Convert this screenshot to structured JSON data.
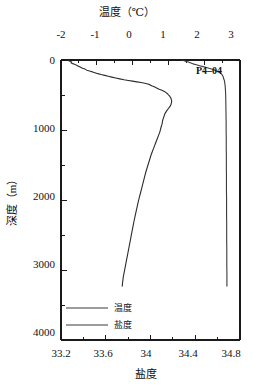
{
  "chart_data": {
    "type": "line",
    "title": "",
    "orientation": "vertical-profile",
    "station": "P4–04",
    "grid": false,
    "legend_position": "bottom-left-inside",
    "top_axis": {
      "label": "温度（℃）",
      "ticks": [
        -2,
        -1,
        0,
        1,
        2,
        3
      ],
      "tick_labels": [
        "-2",
        "-1",
        "0",
        "1",
        "2",
        "3"
      ],
      "range": [
        -2,
        3
      ],
      "minor_tick_step": 0.5
    },
    "bottom_axis": {
      "label": "盐度",
      "ticks": [
        33.2,
        33.6,
        34,
        34.4,
        34.8
      ],
      "tick_labels": [
        "33.2",
        "33.6",
        "34",
        "34.4",
        "34.8"
      ],
      "range": [
        33.2,
        34.8
      ],
      "minor_tick_step": 0.2
    },
    "y_axis": {
      "label": "深度（m）",
      "ticks": [
        0,
        1000,
        2000,
        3000,
        4000
      ],
      "tick_labels": [
        "0",
        "1000",
        "2000",
        "3000",
        "4000"
      ],
      "range": [
        0,
        4000
      ],
      "inverted": true,
      "minor_tick_step": 500
    },
    "series": [
      {
        "name": "温度",
        "legend_label": "温度",
        "axis": "top",
        "unit": "℃",
        "color": "#2b2b2b",
        "points": [
          [
            -1.8,
            0
          ],
          [
            -1.78,
            12
          ],
          [
            -1.74,
            22
          ],
          [
            -1.7,
            30
          ],
          [
            -1.72,
            40
          ],
          [
            -1.68,
            52
          ],
          [
            -1.62,
            62
          ],
          [
            -1.58,
            70
          ],
          [
            -1.55,
            80
          ],
          [
            -1.5,
            92
          ],
          [
            -1.45,
            105
          ],
          [
            -1.4,
            118
          ],
          [
            -1.33,
            130
          ],
          [
            -1.28,
            145
          ],
          [
            -1.2,
            158
          ],
          [
            -1.12,
            170
          ],
          [
            -1.05,
            182
          ],
          [
            -0.97,
            195
          ],
          [
            -0.88,
            208
          ],
          [
            -0.78,
            220
          ],
          [
            -0.68,
            232
          ],
          [
            -0.58,
            245
          ],
          [
            -0.47,
            258
          ],
          [
            -0.36,
            270
          ],
          [
            -0.24,
            282
          ],
          [
            -0.12,
            292
          ],
          [
            0.0,
            302
          ],
          [
            0.12,
            312
          ],
          [
            0.24,
            322
          ],
          [
            0.34,
            332
          ],
          [
            0.42,
            342
          ],
          [
            0.48,
            352
          ],
          [
            0.5,
            360
          ],
          [
            0.55,
            372
          ],
          [
            0.62,
            385
          ],
          [
            0.66,
            396
          ],
          [
            0.7,
            406
          ],
          [
            0.74,
            418
          ],
          [
            0.8,
            430
          ],
          [
            0.86,
            442
          ],
          [
            0.9,
            452
          ],
          [
            0.92,
            462
          ],
          [
            0.95,
            472
          ],
          [
            0.98,
            485
          ],
          [
            1.0,
            498
          ],
          [
            1.03,
            512
          ],
          [
            1.05,
            528
          ],
          [
            1.07,
            545
          ],
          [
            1.08,
            562
          ],
          [
            1.09,
            580
          ],
          [
            1.09,
            600
          ],
          [
            1.08,
            620
          ],
          [
            1.07,
            640
          ],
          [
            1.05,
            660
          ],
          [
            1.02,
            680
          ],
          [
            0.99,
            700
          ],
          [
            0.96,
            720
          ],
          [
            0.93,
            745
          ],
          [
            0.9,
            770
          ],
          [
            0.88,
            800
          ],
          [
            0.86,
            830
          ],
          [
            0.84,
            860
          ],
          [
            0.83,
            890
          ],
          [
            0.82,
            920
          ],
          [
            0.8,
            950
          ],
          [
            0.78,
            990
          ],
          [
            0.76,
            1030
          ],
          [
            0.73,
            1070
          ],
          [
            0.7,
            1110
          ],
          [
            0.67,
            1150
          ],
          [
            0.64,
            1190
          ],
          [
            0.61,
            1230
          ],
          [
            0.58,
            1270
          ],
          [
            0.55,
            1310
          ],
          [
            0.52,
            1350
          ],
          [
            0.49,
            1400
          ],
          [
            0.46,
            1450
          ],
          [
            0.43,
            1500
          ],
          [
            0.4,
            1550
          ],
          [
            0.37,
            1600
          ],
          [
            0.34,
            1660
          ],
          [
            0.31,
            1720
          ],
          [
            0.28,
            1780
          ],
          [
            0.25,
            1840
          ],
          [
            0.22,
            1900
          ],
          [
            0.19,
            1960
          ],
          [
            0.16,
            2020
          ],
          [
            0.13,
            2090
          ],
          [
            0.1,
            2160
          ],
          [
            0.07,
            2230
          ],
          [
            0.04,
            2300
          ],
          [
            0.01,
            2380
          ],
          [
            -0.02,
            2460
          ],
          [
            -0.05,
            2540
          ],
          [
            -0.08,
            2620
          ],
          [
            -0.11,
            2700
          ],
          [
            -0.14,
            2780
          ],
          [
            -0.17,
            2860
          ],
          [
            -0.2,
            2940
          ],
          [
            -0.23,
            3020
          ],
          [
            -0.26,
            3100
          ],
          [
            -0.28,
            3180
          ],
          [
            -0.29,
            3230
          ]
        ]
      },
      {
        "name": "盐度",
        "legend_label": "盐度",
        "axis": "bottom",
        "unit": "",
        "color": "#3a3a3a",
        "points": [
          [
            34.28,
            0
          ],
          [
            34.3,
            10
          ],
          [
            34.32,
            20
          ],
          [
            34.34,
            30
          ],
          [
            34.36,
            42
          ],
          [
            34.38,
            55
          ],
          [
            34.41,
            68
          ],
          [
            34.44,
            82
          ],
          [
            34.47,
            95
          ],
          [
            34.5,
            108
          ],
          [
            34.53,
            122
          ],
          [
            34.56,
            136
          ],
          [
            34.58,
            150
          ],
          [
            34.6,
            165
          ],
          [
            34.62,
            180
          ],
          [
            34.63,
            195
          ],
          [
            34.64,
            210
          ],
          [
            34.645,
            225
          ],
          [
            34.65,
            240
          ],
          [
            34.652,
            255
          ],
          [
            34.655,
            272
          ],
          [
            34.66,
            290
          ],
          [
            34.662,
            310
          ],
          [
            34.664,
            330
          ],
          [
            34.666,
            355
          ],
          [
            34.668,
            380
          ],
          [
            34.669,
            405
          ],
          [
            34.67,
            430
          ],
          [
            34.671,
            460
          ],
          [
            34.672,
            490
          ],
          [
            34.672,
            520
          ],
          [
            34.673,
            560
          ],
          [
            34.673,
            600
          ],
          [
            34.674,
            650
          ],
          [
            34.674,
            700
          ],
          [
            34.675,
            760
          ],
          [
            34.675,
            820
          ],
          [
            34.676,
            880
          ],
          [
            34.676,
            950
          ],
          [
            34.676,
            1020
          ],
          [
            34.677,
            1100
          ],
          [
            34.677,
            1180
          ],
          [
            34.677,
            1260
          ],
          [
            34.678,
            1350
          ],
          [
            34.678,
            1450
          ],
          [
            34.678,
            1550
          ],
          [
            34.679,
            1650
          ],
          [
            34.679,
            1760
          ],
          [
            34.679,
            1870
          ],
          [
            34.68,
            1980
          ],
          [
            34.68,
            2100
          ],
          [
            34.68,
            2220
          ],
          [
            34.681,
            2340
          ],
          [
            34.681,
            2460
          ],
          [
            34.681,
            2580
          ],
          [
            34.682,
            2700
          ],
          [
            34.682,
            2820
          ],
          [
            34.682,
            2940
          ],
          [
            34.683,
            3060
          ],
          [
            34.683,
            3160
          ],
          [
            34.683,
            3230
          ]
        ]
      }
    ]
  },
  "labels": {
    "station": "P4–04",
    "top_axis_title": "温度（℃）",
    "bottom_axis_title": "盐度",
    "y_axis_title": "深度（m）",
    "legend_temperature": "温度",
    "legend_salinity": "盐度",
    "top_ticks": [
      "-2",
      "-1",
      "0",
      "1",
      "2",
      "3"
    ],
    "bottom_ticks": [
      "33.2",
      "33.6",
      "34",
      "34.4",
      "34.8"
    ],
    "depth_ticks": [
      "0",
      "1000",
      "2000",
      "3000",
      "4000"
    ]
  },
  "colors": {
    "temperature": "#2b2b2b",
    "salinity": "#3a3a3a",
    "axis": "#1a1a1a",
    "background": "#ffffff"
  }
}
